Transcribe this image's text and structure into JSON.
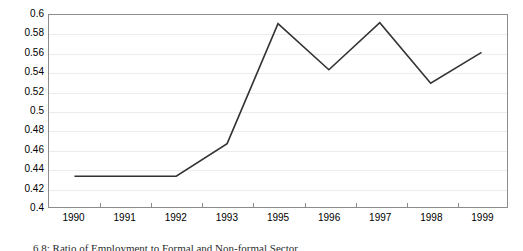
{
  "chart_data": {
    "type": "line",
    "title": "",
    "subtitle": "",
    "xlabel": "",
    "ylabel": "",
    "categories": [
      "1990",
      "1991",
      "1992",
      "1993",
      "1995",
      "1996",
      "1997",
      "1998",
      "1999"
    ],
    "values": [
      0.432,
      0.432,
      0.432,
      0.466,
      0.591,
      0.543,
      0.592,
      0.529,
      0.561
    ],
    "series": [
      {
        "name": "ratio",
        "values": [
          0.432,
          0.432,
          0.432,
          0.466,
          0.591,
          0.543,
          0.592,
          0.529,
          0.561
        ]
      }
    ],
    "ylim": [
      0.4,
      0.6
    ],
    "ytick_step": 0.02,
    "yticks": [
      "0.6",
      "0.58",
      "0.56",
      "0.54",
      "0.52",
      "0.5",
      "0.48",
      "0.46",
      "0.44",
      "0.42",
      "0.4"
    ],
    "ytick_values": [
      0.6,
      0.58,
      0.56,
      0.54,
      0.52,
      0.5,
      0.48,
      0.46,
      0.44,
      0.42,
      0.4
    ],
    "grid": true,
    "grid_orientation": "horizontal",
    "legend": false,
    "legend_position": "none",
    "line_color": "#333333",
    "grid_color": "#ececed",
    "frame_color": "#8c8c8c",
    "plot_background": "#ffffff",
    "annotations": []
  },
  "caption": {
    "text": "6.8: Ratio of Employment to Formal and Non-formal Sector"
  }
}
